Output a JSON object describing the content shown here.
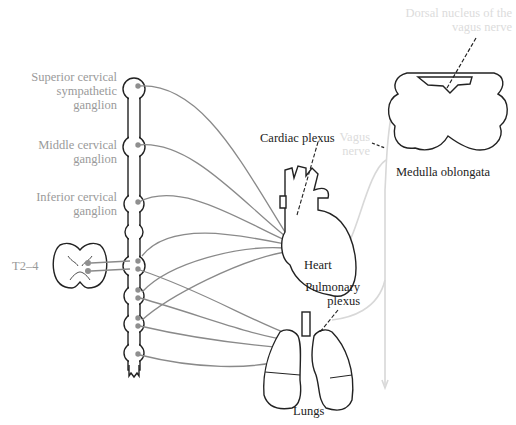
{
  "figure": {
    "colors": {
      "outline": "#222222",
      "sympathetic_fiber": "#8a8a8a",
      "parasympathetic_fiber": "#d8d8d8",
      "ganglion_dot": "#8f8f8f",
      "label_grey": "#9a9a9a",
      "label_dark": "#222222",
      "label_faint": "#dcdcdc"
    },
    "labels": {
      "superior_cervical_line1": "Superior cervical",
      "superior_cervical_line2": "sympathetic",
      "superior_cervical_line3": "ganglion",
      "middle_cervical_line1": "Middle cervical",
      "middle_cervical_line2": "ganglion",
      "inferior_cervical_line1": "Inferior cervical",
      "inferior_cervical_line2": "ganglion",
      "spinal_level": "T2–4",
      "cardiac_plexus": "Cardiac plexus",
      "heart": "Heart",
      "pulmonary_plexus_line1": "Pulmonary",
      "pulmonary_plexus_line2": "plexus",
      "lungs": "Lungs",
      "dorsal_nucleus_line1": "Dorsal nucleus of the",
      "dorsal_nucleus_line2": "vagus nerve",
      "vagus_nerve_line1": "Vagus",
      "vagus_nerve_line2": "nerve",
      "medulla": "Medulla oblongata"
    }
  }
}
